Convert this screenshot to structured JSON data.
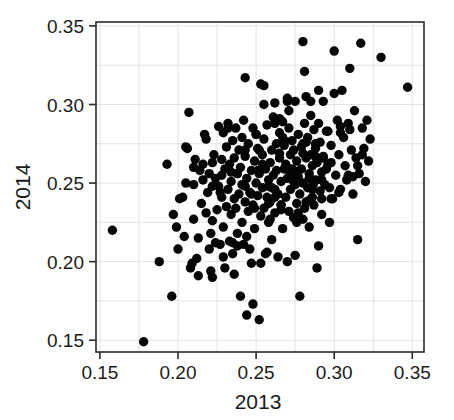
{
  "figure": {
    "background_color": "#ffffff",
    "point_color": "#050505",
    "axis_color": "#2b2b2b",
    "grid_color": "#e2e2e2"
  },
  "chart_data": {
    "type": "scatter",
    "title": "",
    "xlabel": "2013",
    "ylabel": "2014",
    "xlim": [
      0.1475,
      0.3575
    ],
    "ylim": [
      0.1425,
      0.3525
    ],
    "xticks": [
      0.15,
      0.2,
      0.25,
      0.3,
      0.35
    ],
    "yticks": [
      0.15,
      0.2,
      0.25,
      0.3,
      0.35
    ],
    "xticklabels": [
      "0.15",
      "0.20",
      "0.25",
      "0.30",
      "0.35"
    ],
    "yticklabels": [
      "0.15",
      "0.20",
      "0.25",
      "0.30",
      "0.35"
    ],
    "grid": true,
    "grid_step": 0.025,
    "legend": null,
    "marker": "circle",
    "marker_size_px": 9.4,
    "n_points": 292,
    "x": [
      0.158,
      0.178,
      0.188,
      0.193,
      0.196,
      0.197,
      0.199,
      0.2,
      0.201,
      0.203,
      0.204,
      0.205,
      0.206,
      0.207,
      0.208,
      0.209,
      0.21,
      0.21,
      0.211,
      0.212,
      0.213,
      0.214,
      0.215,
      0.216,
      0.217,
      0.218,
      0.218,
      0.219,
      0.22,
      0.221,
      0.222,
      0.222,
      0.223,
      0.224,
      0.224,
      0.225,
      0.226,
      0.226,
      0.227,
      0.228,
      0.228,
      0.229,
      0.229,
      0.23,
      0.23,
      0.231,
      0.231,
      0.232,
      0.232,
      0.233,
      0.233,
      0.234,
      0.234,
      0.235,
      0.235,
      0.236,
      0.236,
      0.237,
      0.237,
      0.238,
      0.238,
      0.239,
      0.239,
      0.24,
      0.24,
      0.241,
      0.241,
      0.242,
      0.242,
      0.243,
      0.243,
      0.244,
      0.244,
      0.245,
      0.245,
      0.246,
      0.246,
      0.247,
      0.247,
      0.248,
      0.248,
      0.249,
      0.249,
      0.25,
      0.25,
      0.251,
      0.251,
      0.252,
      0.252,
      0.253,
      0.253,
      0.254,
      0.254,
      0.255,
      0.255,
      0.256,
      0.256,
      0.257,
      0.257,
      0.258,
      0.258,
      0.259,
      0.259,
      0.26,
      0.26,
      0.261,
      0.261,
      0.262,
      0.262,
      0.263,
      0.263,
      0.264,
      0.264,
      0.265,
      0.265,
      0.266,
      0.266,
      0.267,
      0.267,
      0.268,
      0.268,
      0.269,
      0.269,
      0.27,
      0.27,
      0.271,
      0.271,
      0.272,
      0.272,
      0.273,
      0.273,
      0.274,
      0.274,
      0.275,
      0.275,
      0.276,
      0.276,
      0.277,
      0.277,
      0.278,
      0.278,
      0.279,
      0.279,
      0.28,
      0.28,
      0.281,
      0.281,
      0.282,
      0.282,
      0.283,
      0.283,
      0.284,
      0.284,
      0.285,
      0.285,
      0.286,
      0.286,
      0.287,
      0.287,
      0.288,
      0.288,
      0.289,
      0.289,
      0.29,
      0.29,
      0.291,
      0.291,
      0.292,
      0.292,
      0.293,
      0.293,
      0.294,
      0.295,
      0.296,
      0.297,
      0.298,
      0.299,
      0.3,
      0.301,
      0.302,
      0.303,
      0.304,
      0.305,
      0.306,
      0.307,
      0.308,
      0.309,
      0.31,
      0.311,
      0.312,
      0.313,
      0.314,
      0.315,
      0.316,
      0.317,
      0.318,
      0.319,
      0.32,
      0.321,
      0.322,
      0.323,
      0.33,
      0.347,
      0.222,
      0.234,
      0.241,
      0.247,
      0.252,
      0.255,
      0.258,
      0.262,
      0.266,
      0.27,
      0.273,
      0.277,
      0.28,
      0.284,
      0.288,
      0.292,
      0.296,
      0.21,
      0.216,
      0.221,
      0.227,
      0.232,
      0.238,
      0.243,
      0.249,
      0.254,
      0.26,
      0.265,
      0.271,
      0.276,
      0.282,
      0.287,
      0.293,
      0.298,
      0.304,
      0.309,
      0.315,
      0.205,
      0.213,
      0.22,
      0.228,
      0.235,
      0.243,
      0.25,
      0.258,
      0.265,
      0.273,
      0.28,
      0.288,
      0.295,
      0.303,
      0.31,
      0.318,
      0.243,
      0.253,
      0.262,
      0.271,
      0.281,
      0.29,
      0.262,
      0.268,
      0.274,
      0.28,
      0.286,
      0.292,
      0.298,
      0.248,
      0.257,
      0.266,
      0.275,
      0.284,
      0.229,
      0.236,
      0.244,
      0.251,
      0.259,
      0.267,
      0.274,
      0.282,
      0.289,
      0.297,
      0.304,
      0.312,
      0.255,
      0.27,
      0.285,
      0.3,
      0.222,
      0.238
    ],
    "y": [
      0.22,
      0.149,
      0.2,
      0.262,
      0.178,
      0.23,
      0.222,
      0.208,
      0.24,
      0.241,
      0.216,
      0.25,
      0.272,
      0.295,
      0.196,
      0.199,
      0.26,
      0.227,
      0.265,
      0.202,
      0.215,
      0.258,
      0.237,
      0.252,
      0.281,
      0.278,
      0.231,
      0.244,
      0.208,
      0.194,
      0.19,
      0.226,
      0.268,
      0.253,
      0.212,
      0.233,
      0.286,
      0.248,
      0.211,
      0.255,
      0.241,
      0.282,
      0.222,
      0.259,
      0.196,
      0.273,
      0.235,
      0.246,
      0.288,
      0.213,
      0.262,
      0.251,
      0.23,
      0.277,
      0.205,
      0.24,
      0.266,
      0.234,
      0.285,
      0.218,
      0.256,
      0.271,
      0.243,
      0.178,
      0.26,
      0.225,
      0.249,
      0.29,
      0.211,
      0.238,
      0.267,
      0.166,
      0.253,
      0.232,
      0.275,
      0.208,
      0.244,
      0.258,
      0.199,
      0.285,
      0.236,
      0.264,
      0.221,
      0.25,
      0.281,
      0.242,
      0.272,
      0.163,
      0.256,
      0.199,
      0.229,
      0.268,
      0.247,
      0.234,
      0.278,
      0.259,
      0.205,
      0.241,
      0.287,
      0.252,
      0.225,
      0.263,
      0.238,
      0.271,
      0.214,
      0.255,
      0.292,
      0.246,
      0.231,
      0.275,
      0.258,
      0.203,
      0.243,
      0.282,
      0.266,
      0.236,
      0.251,
      0.289,
      0.221,
      0.259,
      0.274,
      0.241,
      0.262,
      0.2,
      0.253,
      0.285,
      0.232,
      0.268,
      0.246,
      0.277,
      0.257,
      0.228,
      0.271,
      0.249,
      0.302,
      0.237,
      0.264,
      0.254,
      0.281,
      0.178,
      0.243,
      0.273,
      0.259,
      0.34,
      0.25,
      0.288,
      0.234,
      0.266,
      0.305,
      0.247,
      0.279,
      0.256,
      0.222,
      0.268,
      0.293,
      0.241,
      0.261,
      0.284,
      0.236,
      0.272,
      0.252,
      0.196,
      0.264,
      0.21,
      0.288,
      0.245,
      0.276,
      0.257,
      0.23,
      0.267,
      0.302,
      0.249,
      0.283,
      0.262,
      0.225,
      0.274,
      0.24,
      0.334,
      0.255,
      0.29,
      0.268,
      0.246,
      0.309,
      0.279,
      0.261,
      0.252,
      0.288,
      0.323,
      0.271,
      0.243,
      0.296,
      0.266,
      0.214,
      0.256,
      0.339,
      0.285,
      0.272,
      0.251,
      0.29,
      0.264,
      0.278,
      0.33,
      0.311,
      0.263,
      0.257,
      0.279,
      0.243,
      0.271,
      0.312,
      0.248,
      0.288,
      0.236,
      0.302,
      0.259,
      0.231,
      0.275,
      0.253,
      0.267,
      0.24,
      0.283,
      0.249,
      0.262,
      0.218,
      0.244,
      0.285,
      0.256,
      0.271,
      0.234,
      0.262,
      0.247,
      0.291,
      0.258,
      0.225,
      0.276,
      0.25,
      0.266,
      0.24,
      0.282,
      0.255,
      0.261,
      0.273,
      0.191,
      0.256,
      0.265,
      0.212,
      0.248,
      0.281,
      0.237,
      0.269,
      0.253,
      0.227,
      0.275,
      0.259,
      0.244,
      0.284,
      0.268,
      0.317,
      0.313,
      0.301,
      0.296,
      0.321,
      0.309,
      0.241,
      0.277,
      0.258,
      0.269,
      0.246,
      0.252,
      0.263,
      0.173,
      0.206,
      0.233,
      0.204,
      0.239,
      0.203,
      0.192,
      0.216,
      0.258,
      0.227,
      0.279,
      0.251,
      0.238,
      0.263,
      0.247,
      0.286,
      0.254,
      0.3,
      0.304,
      0.302,
      0.307,
      0.248,
      0.21
    ]
  }
}
